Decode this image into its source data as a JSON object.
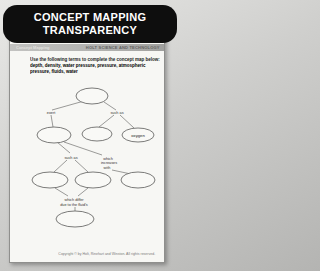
{
  "banner": {
    "title_line1": "CONCEPT MAPPING",
    "title_line2": "TRANSPARENCY"
  },
  "page_header": {
    "left": "Concept Mapping",
    "right": "HOLT SCIENCE AND TECHNOLOGY"
  },
  "instructions": {
    "prompt": "Use the following terms to complete the concept map below:",
    "terms": "depth, density, water pressure, pressure, atmospheric pressure, fluids, water"
  },
  "concept_map": {
    "prefilled_node": "oxygen",
    "blank_node_count": 7,
    "labels": {
      "exert": "exert",
      "such_as_top": "such as",
      "such_as_mid": "such as",
      "increases": [
        "which",
        "increases",
        "with"
      ],
      "differ": [
        "which differ",
        "due to the fluid's"
      ]
    }
  },
  "footer": {
    "copyright": "Copyright © by Holt, Rinehart and Winston. All rights reserved."
  },
  "colors": {
    "banner_bg": "#0e0e0e",
    "banner_text": "#ffffff",
    "page_bg": "#f7f7f4",
    "header_bar_bg": "#b3b3b1",
    "map_stroke": "#5b5b59"
  }
}
